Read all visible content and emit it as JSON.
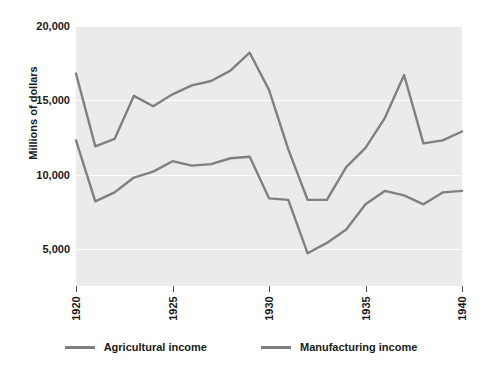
{
  "chart_data": {
    "type": "line",
    "title": "",
    "xlabel": "",
    "ylabel": "Millions of dollars",
    "xlim": [
      1920,
      1940
    ],
    "ylim": [
      2500,
      20000
    ],
    "grid": true,
    "legend_position": "bottom",
    "x": [
      1920,
      1921,
      1922,
      1923,
      1924,
      1925,
      1926,
      1927,
      1928,
      1929,
      1930,
      1931,
      1932,
      1933,
      1934,
      1935,
      1936,
      1937,
      1938,
      1939,
      1940
    ],
    "x_ticks": [
      "1920",
      "1925",
      "1930",
      "1935",
      "1940"
    ],
    "y_ticks": [
      "20,000",
      "15,000",
      "10,000",
      "5,000"
    ],
    "y_tick_values": [
      20000,
      15000,
      10000,
      5000
    ],
    "series": [
      {
        "name": "Agricultural income",
        "color": "#808080",
        "values": [
          12300,
          8200,
          8800,
          9800,
          10200,
          10900,
          10600,
          10700,
          11100,
          11200,
          8400,
          8300,
          4700,
          5400,
          6300,
          8000,
          8900,
          8600,
          8000,
          8800,
          8900
        ]
      },
      {
        "name": "Manufacturing income",
        "color": "#808080",
        "values": [
          16800,
          11900,
          12400,
          15300,
          14600,
          15400,
          16000,
          16300,
          17000,
          18200,
          15700,
          11700,
          8300,
          8300,
          10500,
          11800,
          13800,
          16700,
          12100,
          12300,
          12900
        ]
      }
    ]
  },
  "legend": {
    "items": [
      {
        "label": "Agricultural income",
        "color": "#808080"
      },
      {
        "label": "Manufacturing income",
        "color": "#808080"
      }
    ]
  },
  "axes": {
    "y_title": "Millions of dollars"
  }
}
